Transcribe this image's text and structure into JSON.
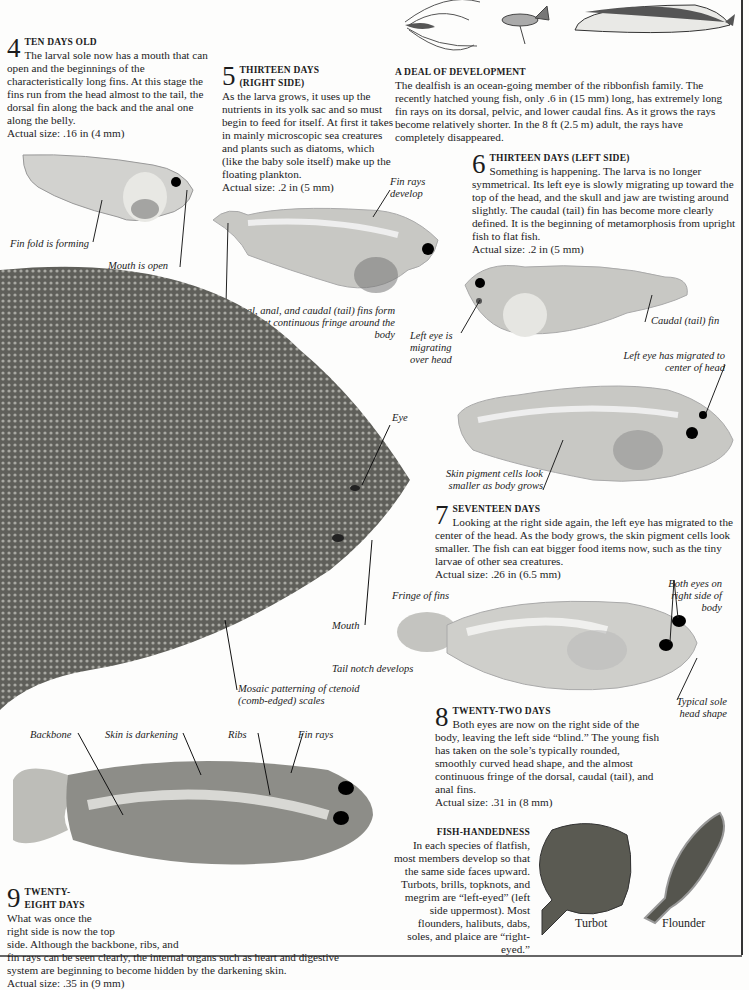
{
  "sections": {
    "s4": {
      "number": "4",
      "heading": "TEN DAYS OLD",
      "body": "The larval sole now has a mouth that can open and the beginnings of the characteristically long fins. At this stage the fins run from the head almost to the tail, the dorsal fin along the back and the anal one along the belly.",
      "size": "Actual size: .16 in (4 mm)",
      "labels": [
        "Fin fold is forming",
        "Mouth is open"
      ]
    },
    "s5": {
      "number": "5",
      "heading_line1": "THIRTEEN DAYS",
      "heading_line2": "(RIGHT SIDE)",
      "body": "As the larva grows, it uses up the nutrients in its yolk sac and so must begin to feed for itself. At first it takes in mainly microscopic sea creatures and plants such as diatoms, which (like the baby sole itself) make up the floating plankton.",
      "size": "Actual size: .2 in (5 mm)",
      "labels": [
        "Fin rays develop",
        "Dorsal, anal, and caudal (tail) fins form an almost continuous fringe around the body"
      ]
    },
    "dealfish": {
      "heading": "A DEAL OF DEVELOPMENT",
      "body": "The dealfish is an ocean-going member of the ribbonfish family. The recently hatched young fish, only .6 in (15 mm) long, has extremely long fin rays on its dorsal, pelvic, and lower caudal fins. As it grows the rays become relatively shorter. In the 8 ft (2.5 m) adult, the rays have completely disappeared."
    },
    "s6": {
      "number": "6",
      "heading": "THIRTEEN DAYS (LEFT SIDE)",
      "body": "Something is happening. The larva is no longer symmetrical. Its left eye is slowly migrating up toward the top of the head, and the skull and jaw are twisting around slightly. The caudal (tail) fin has become more clearly defined. It is the beginning of metamorphosis from upright fish to flat fish.",
      "size": "Actual size: .2 in (5 mm)",
      "labels": [
        "Caudal  (tail) fin",
        "Left eye is migrating over head",
        "Left eye has migrated to center of head",
        "Skin pigment cells look smaller as body grows"
      ]
    },
    "adult": {
      "labels": [
        "Eye",
        "Mouth",
        "Mosaic patterning of ctenoid (comb-edged) scales"
      ]
    },
    "s7": {
      "number": "7",
      "heading": "SEVENTEEN DAYS",
      "body": "Looking at the right side again, the left eye has migrated to the center of the head. As the body grows, the skin pigment cells look smaller. The fish can eat bigger food items now, such as the tiny larvae of other sea creatures.",
      "size": "Actual size: .26 in (6.5 mm)",
      "labels": [
        "Fringe of fins",
        "Tail notch develops",
        "Both eyes on right side of body",
        "Typical sole head shape"
      ]
    },
    "s8": {
      "number": "8",
      "heading": "TWENTY-TWO DAYS",
      "body": "Both eyes are now on the right side of the body, leaving the left side “blind.” The young fish has taken on the sole’s typically rounded, smoothly curved head shape, and the almost continuous fringe of the dorsal, caudal (tail), and anal fins.",
      "size": "Actual size: .31 in (8 mm)"
    },
    "s9": {
      "number": "9",
      "heading_line1": "TWENTY-",
      "heading_line2": "EIGHT DAYS",
      "body_l1": "What was once the",
      "body_l2": "right side is now the top",
      "body_l3": "side. Although the backbone, ribs, and",
      "body_l4": "fin rays can be seen clearly, the internal organs such as heart and digestive",
      "body_l5": "system are beginning to become hidden by the darkening skin.",
      "size": "Actual size: .35 in (9 mm)",
      "labels": [
        "Backbone",
        "Skin is darkening",
        "Ribs",
        "Fin rays"
      ]
    },
    "handedness": {
      "heading": "FISH-HANDEDNESS",
      "body": "In each species of flatfish, most members develop so that the same side faces upward. Turbots, brills, topknots, and megrim are “left-eyed” (left side uppermost). Most flounders, halibuts, dabs, soles, and plaice are “right-eyed.”",
      "captions": [
        "Turbot",
        "Flounder"
      ]
    }
  },
  "colors": {
    "larva_fill": "#c9c9c6",
    "adult_fill": "#6b6b66",
    "ink": "#1a1a1a"
  }
}
